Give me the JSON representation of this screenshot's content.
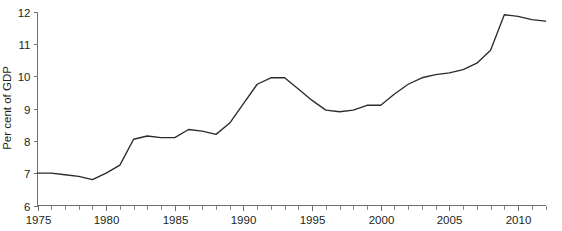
{
  "chart_data": {
    "type": "line",
    "title": "",
    "subtitle": "",
    "xlabel": "",
    "ylabel": "Per cent of GDP",
    "xlim": [
      1975,
      2012
    ],
    "ylim": [
      6,
      12
    ],
    "grid": false,
    "legend": null,
    "legend_position": "none",
    "x_tick_labels": [
      "1975",
      "1980",
      "1985",
      "1990",
      "1995",
      "2000",
      "2005",
      "2010"
    ],
    "x_tick_values": [
      1975,
      1980,
      1985,
      1990,
      1995,
      2000,
      2005,
      2010
    ],
    "x_minor_tick_step": 1,
    "y_tick_labels": [
      "6",
      "7",
      "8",
      "9",
      "10",
      "11",
      "12"
    ],
    "y_tick_values": [
      6,
      7,
      8,
      9,
      10,
      11,
      12
    ],
    "series": [
      {
        "name": "Per cent of GDP",
        "color": "#2b2b2b",
        "x": [
          1975,
          1976,
          1977,
          1978,
          1979,
          1980,
          1981,
          1982,
          1983,
          1984,
          1985,
          1986,
          1987,
          1988,
          1989,
          1990,
          1991,
          1992,
          1993,
          1994,
          1995,
          1996,
          1997,
          1998,
          1999,
          2000,
          2001,
          2002,
          2003,
          2004,
          2005,
          2006,
          2007,
          2008,
          2009,
          2010,
          2011,
          2012
        ],
        "values": [
          7.0,
          7.0,
          6.95,
          6.9,
          6.8,
          7.0,
          7.25,
          8.05,
          8.15,
          8.1,
          8.1,
          8.35,
          8.3,
          8.2,
          8.55,
          9.15,
          9.75,
          9.95,
          9.95,
          9.6,
          9.25,
          8.95,
          8.9,
          8.95,
          9.1,
          9.1,
          9.45,
          9.75,
          9.95,
          10.05,
          10.1,
          10.2,
          10.4,
          10.8,
          11.9,
          11.85,
          11.75,
          11.7
        ]
      }
    ],
    "annotations": []
  }
}
